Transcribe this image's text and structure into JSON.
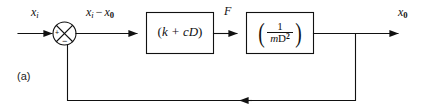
{
  "figure": {
    "caption": "(a)",
    "type": "block-diagram"
  },
  "colors": {
    "line": "#111111",
    "background": "#ffffff",
    "text": "#111111"
  },
  "signals": {
    "input": {
      "base": "x",
      "sub": "i",
      "full": "xᵢ"
    },
    "error": {
      "left": "x",
      "left_sub": "i",
      "operator": "−",
      "right": "x",
      "right_sub": "0",
      "full": "xᵢ − x₀"
    },
    "force": {
      "label": "F"
    },
    "output": {
      "base": "x",
      "sub": "0",
      "full": "x₀"
    }
  },
  "summing_junction": {
    "name": "summing-junction",
    "shape": "circle-with-cross",
    "plus_sign": "+",
    "minus_sign": "−"
  },
  "blocks": [
    {
      "id": "stiffness-damping",
      "open_paren": "(",
      "expr": "k + cD",
      "close_paren": ")",
      "full": "(k + cD)"
    },
    {
      "id": "mass-inertia",
      "open_paren": "(",
      "numerator": "1",
      "denominator_m": "m",
      "denominator_D": "D",
      "denominator_exp": "2",
      "close_paren": ")",
      "full": "( 1 / mD² )"
    }
  ],
  "feedback": {
    "name": "feedback-path",
    "direction": "right-to-left",
    "arrow": "◀"
  }
}
